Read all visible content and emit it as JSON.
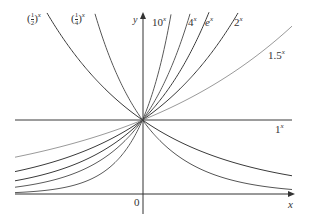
{
  "chart_data": {
    "type": "line",
    "title": "",
    "xlabel": "x",
    "ylabel": "y",
    "origin_label": "0",
    "xlim": [
      -1.72,
      2.05
    ],
    "ylim": [
      -0.27,
      2.43
    ],
    "grid": false,
    "legend": "inline labels",
    "series": [
      {
        "name": "(1/2)^x",
        "base": 0.5,
        "label_base": "1/2",
        "color": "#3a3a3a"
      },
      {
        "name": "(1/4)^x",
        "base": 0.25,
        "label_base": "1/4",
        "color": "#555555"
      },
      {
        "name": "10^x",
        "base": 10,
        "label_base": "10",
        "color": "#5a5a5a"
      },
      {
        "name": "4^x",
        "base": 4,
        "label_base": "4",
        "color": "#5a5a5a"
      },
      {
        "name": "e^x",
        "base": 2.718281828,
        "label_base": "e",
        "color": "#3a3a3a"
      },
      {
        "name": "2^x",
        "base": 2,
        "label_base": "2",
        "color": "#3a3a3a"
      },
      {
        "name": "1.5^x",
        "base": 1.5,
        "label_base": "1.5",
        "color": "#9a9a9a"
      },
      {
        "name": "1^x",
        "base": 1,
        "label_base": "1",
        "color": "#3a3a3a"
      }
    ],
    "annotations": [
      "all curves pass through (0, 1)"
    ]
  },
  "labels": {
    "half": {
      "num": "1",
      "den": "2",
      "exp": "x"
    },
    "quarter": {
      "num": "1",
      "den": "4",
      "exp": "x"
    },
    "ten": {
      "base": "10",
      "exp": "x"
    },
    "four": {
      "base": "4",
      "exp": "x"
    },
    "e": {
      "base": "e",
      "exp": "x"
    },
    "two": {
      "base": "2",
      "exp": "x"
    },
    "onefive": {
      "base": "1.5",
      "exp": "x"
    },
    "one": {
      "base": "1",
      "exp": "x"
    },
    "y_axis": "y",
    "x_axis": "x",
    "origin": "0"
  }
}
